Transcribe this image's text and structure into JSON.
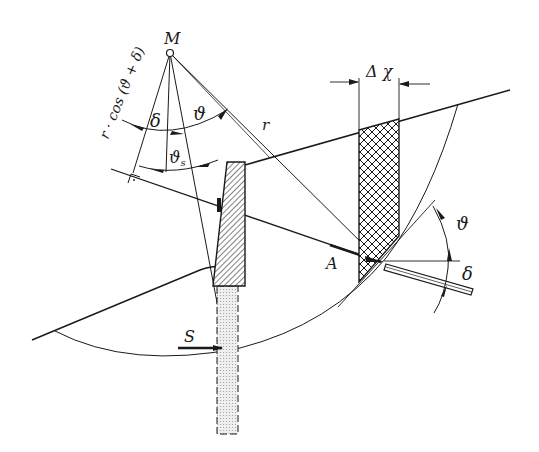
{
  "diagram": {
    "title": "",
    "type": "slope stability with retaining wall and anchor",
    "labels": {
      "center": "M",
      "radius": "r",
      "lever_arm": "r · cos (ϑ + δ)",
      "delta_top": "δ",
      "theta_top": "ϑ",
      "theta_s": "ϑ",
      "theta_s_sub": "s",
      "width": "Δ χ",
      "anchor_point": "A",
      "theta_right": "ϑ",
      "delta_right": "δ",
      "force_s": "S"
    },
    "colors": {
      "ink": "#1a1a1a",
      "background": "#ffffff",
      "pile_fill": "#d8d8d8"
    }
  }
}
